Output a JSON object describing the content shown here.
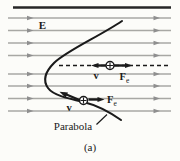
{
  "figure": {
    "field_label": "E",
    "velocity_label": "v",
    "force_label": {
      "main": "F",
      "sub": "e"
    },
    "curve_label": "Parabola",
    "caption": "(a)",
    "charge_sign": "+"
  },
  "field_lines": {
    "direction": "right",
    "y_positions": [
      18,
      30.5,
      43,
      55.5,
      74,
      86,
      98.5,
      111
    ],
    "x_start": 8,
    "x_end": 171,
    "left_arrow_tip_x": 33.5,
    "right_arrow_tip_x": 160
  },
  "colors": {
    "background": "#fcfcf9",
    "field_line": "#a8a8a4",
    "field_arrow": "#8f8f8f",
    "ink": "#1a1a1a"
  }
}
